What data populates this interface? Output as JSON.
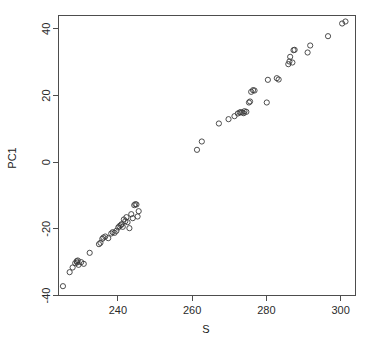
{
  "chart_data": {
    "type": "scatter",
    "title": "",
    "xlabel": "S",
    "ylabel": "PC1",
    "xlim": [
      224,
      304
    ],
    "ylim": [
      -40,
      44
    ],
    "xticks": [
      240,
      260,
      280,
      300
    ],
    "yticks": [
      -40,
      -20,
      0,
      20,
      40
    ],
    "xtick_labels": [
      "240",
      "260",
      "280",
      "300"
    ],
    "ytick_labels": [
      "-40",
      "-20",
      "0",
      "20",
      "40"
    ],
    "grid": false,
    "legend": null,
    "marker": "open-circle",
    "marker_color": "#3a3a3a",
    "n_points": 70,
    "points": [
      [
        225.2,
        -37.2
      ],
      [
        227.0,
        -33.0
      ],
      [
        227.8,
        -31.6
      ],
      [
        228.5,
        -30.3
      ],
      [
        228.9,
        -29.7
      ],
      [
        229.0,
        -30.1
      ],
      [
        229.2,
        -29.5
      ],
      [
        229.4,
        -30.8
      ],
      [
        230.1,
        -30.0
      ],
      [
        230.8,
        -30.5
      ],
      [
        232.4,
        -27.2
      ],
      [
        234.9,
        -24.6
      ],
      [
        235.3,
        -24.2
      ],
      [
        235.8,
        -23.0
      ],
      [
        236.1,
        -22.6
      ],
      [
        236.6,
        -22.3
      ],
      [
        237.4,
        -22.8
      ],
      [
        238.2,
        -21.4
      ],
      [
        238.6,
        -21.0
      ],
      [
        239.1,
        -21.2
      ],
      [
        239.6,
        -20.6
      ],
      [
        240.1,
        -19.6
      ],
      [
        240.4,
        -19.2
      ],
      [
        240.8,
        -18.9
      ],
      [
        241.0,
        -18.6
      ],
      [
        241.3,
        -19.4
      ],
      [
        241.6,
        -17.2
      ],
      [
        242.0,
        -17.7
      ],
      [
        242.3,
        -16.5
      ],
      [
        242.6,
        -18.0
      ],
      [
        243.1,
        -19.8
      ],
      [
        243.6,
        -15.6
      ],
      [
        244.0,
        -16.8
      ],
      [
        244.4,
        -12.9
      ],
      [
        244.7,
        -12.6
      ],
      [
        245.0,
        -12.7
      ],
      [
        245.3,
        -16.3
      ],
      [
        245.6,
        -14.7
      ],
      [
        261.3,
        3.7
      ],
      [
        262.6,
        6.2
      ],
      [
        267.2,
        11.6
      ],
      [
        269.8,
        12.9
      ],
      [
        271.4,
        13.8
      ],
      [
        272.3,
        14.6
      ],
      [
        272.8,
        14.9
      ],
      [
        273.1,
        15.0
      ],
      [
        273.5,
        14.9
      ],
      [
        274.1,
        15.3
      ],
      [
        274.6,
        15.1
      ],
      [
        275.3,
        17.9
      ],
      [
        275.6,
        18.2
      ],
      [
        275.9,
        21.1
      ],
      [
        276.4,
        21.6
      ],
      [
        276.8,
        21.5
      ],
      [
        280.1,
        17.9
      ],
      [
        280.4,
        24.7
      ],
      [
        282.8,
        25.2
      ],
      [
        283.3,
        24.8
      ],
      [
        285.9,
        29.4
      ],
      [
        286.2,
        30.2
      ],
      [
        286.4,
        31.6
      ],
      [
        287.0,
        29.9
      ],
      [
        287.3,
        33.6
      ],
      [
        287.6,
        33.7
      ],
      [
        291.1,
        32.9
      ],
      [
        291.8,
        35.0
      ],
      [
        296.6,
        37.8
      ],
      [
        300.4,
        41.6
      ],
      [
        301.3,
        42.2
      ],
      [
        273.9,
        14.7
      ]
    ]
  },
  "axes": {
    "x_title": "S",
    "y_title": "PC1"
  }
}
